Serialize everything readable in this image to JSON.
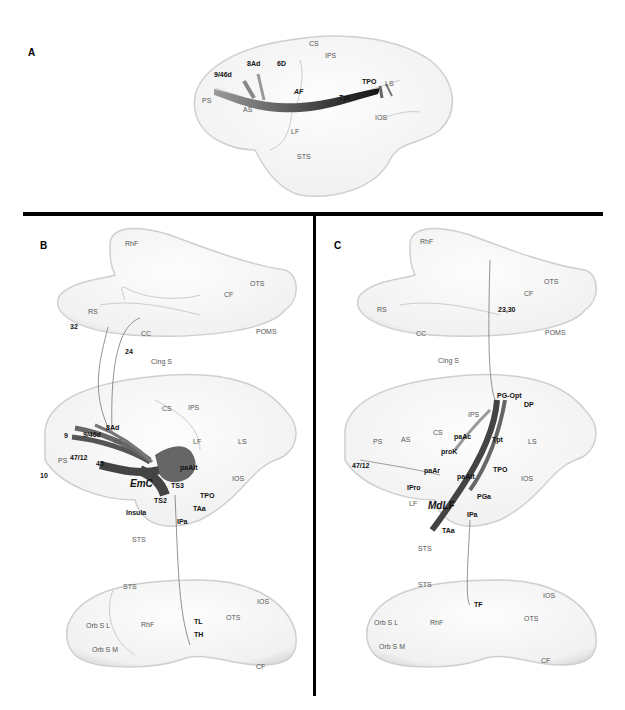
{
  "figure": {
    "panels": [
      {
        "id": "A",
        "letter": "A",
        "view": "lateral",
        "tract": "AF",
        "sulci": {
          "CS": "CS",
          "IPS": "IPS",
          "PS": "PS",
          "AS": "AS",
          "LS": "LS",
          "IOS": "IOS",
          "LF": "LF",
          "STS": "STS"
        },
        "areas": {
          "a946d": "9/46d",
          "a8Ad": "8Ad",
          "a6D": "6D",
          "Tpt": "Tpt",
          "TPO": "TPO"
        }
      },
      {
        "id": "B",
        "letter": "B",
        "tract": "EmC",
        "medial": {
          "RhF": "RhF",
          "OTS": "OTS",
          "CF": "CF",
          "RS": "RS",
          "CC": "CC",
          "POMS": "POMS",
          "CingS": "Cing S",
          "a32": "32",
          "a24": "24"
        },
        "lateral": {
          "CS": "CS",
          "IPS": "IPS",
          "a8Ad": "8Ad",
          "a9": "9",
          "a946d": "9/46d",
          "AS": "AS",
          "LF": "LF",
          "LS": "LS",
          "PS": "PS",
          "a4712": "47/12",
          "a45": "45",
          "a10": "10",
          "paAlt": "paAlt",
          "TS3": "TS3",
          "TPO": "TPO",
          "IOS": "IOS",
          "Insula": "Insula",
          "TS2": "TS2",
          "TAa": "TAa",
          "IPa": "IPa",
          "STS": "STS"
        },
        "ventral": {
          "STS": "STS",
          "IOS": "IOS",
          "OTS": "OTS",
          "OrbSL": "Orb S L",
          "RhF": "RhF",
          "TL": "TL",
          "TH": "TH",
          "OrbSM": "Orb S M",
          "CF": "CF"
        }
      },
      {
        "id": "C",
        "letter": "C",
        "tract": "MdLF",
        "medial": {
          "RhF": "RhF",
          "OTS": "OTS",
          "CF": "CF",
          "RS": "RS",
          "CC": "CC",
          "a2330": "23,30",
          "POMS": "POMS",
          "CingS": "Cing S"
        },
        "lateral": {
          "PGOpt": "PG-Opt",
          "DP": "DP",
          "IPS": "IPS",
          "CS": "CS",
          "PS": "PS",
          "AS": "AS",
          "paAc": "paAc",
          "Tpt": "Tpt",
          "LS": "LS",
          "proK": "proK",
          "a4712": "47/12",
          "paAr": "paAr",
          "paAlt": "paAlt",
          "TPO": "TPO",
          "IOS": "IOS",
          "IPro": "IPro",
          "PGa": "PGa",
          "LF": "LF",
          "IPa": "IPa",
          "TAa": "TAa",
          "STS": "STS"
        },
        "ventral": {
          "STS": "STS",
          "TF": "TF",
          "IOS": "IOS",
          "OrbSL": "Orb S L",
          "RhF": "RhF",
          "OTS": "OTS",
          "OrbSM": "Orb S M",
          "CF": "CF"
        }
      }
    ],
    "colors": {
      "tract": "#4a4a4a",
      "tract_dark": "#222222",
      "brain_fill": "#f7f7f7",
      "brain_edge": "#c8c8c8",
      "divider": "#000000"
    }
  }
}
